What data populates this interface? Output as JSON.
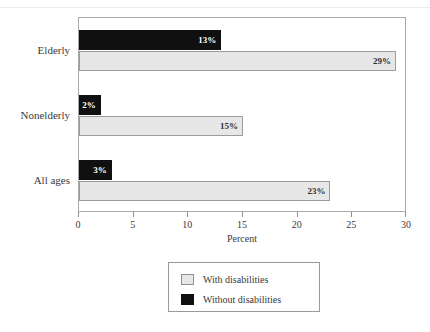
{
  "top_remnant": {
    "text": "     ",
    "note": "faint cropped text above figure"
  },
  "chart_data": {
    "type": "bar",
    "orientation": "horizontal",
    "title": "",
    "subtitle": "",
    "xlabel": "Percent",
    "ylabel": "",
    "xlim": [
      0,
      30
    ],
    "ylim": [],
    "grid": false,
    "legend_position": "bottom",
    "xticks": [
      0,
      5,
      10,
      15,
      20,
      25,
      30
    ],
    "xtick_labels": [
      "0",
      "5",
      "10",
      "15",
      "20",
      "25",
      "30"
    ],
    "categories": [
      "Elderly",
      "Nonelderly",
      "All ages"
    ],
    "series": [
      {
        "name": "Without disabilities",
        "color": "#101010",
        "values": [
          13,
          2,
          3
        ],
        "labels": [
          "13%",
          "2%",
          "3%"
        ]
      },
      {
        "name": "With disabilities",
        "color": "#e7e7e7",
        "values": [
          29,
          15,
          23
        ],
        "labels": [
          "29%",
          "15%",
          "23%"
        ]
      }
    ]
  },
  "legend": {
    "entries": [
      {
        "label": "With disabilities",
        "swatch": "with"
      },
      {
        "label": "Without disabilities",
        "swatch": "without"
      }
    ]
  },
  "colors": {
    "with_disabilities": "#e7e7e7",
    "without_disabilities": "#101010",
    "frame": "#a9a9a9",
    "text": "#3a3a3a"
  }
}
